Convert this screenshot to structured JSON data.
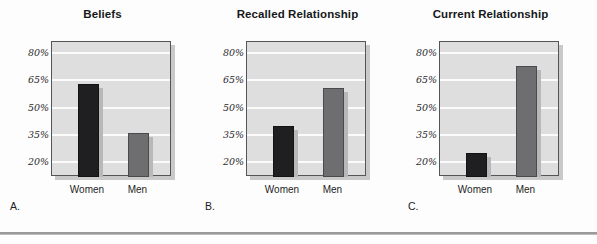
{
  "figure": {
    "panel_letters": [
      "A.",
      "B.",
      "C."
    ],
    "axis": {
      "ticks": [
        "80%",
        "65%",
        "50%",
        "35%",
        "20%"
      ],
      "categories": [
        "Women",
        "Men"
      ]
    }
  },
  "chart_data": [
    {
      "type": "bar",
      "panel": "A.",
      "title": "Beliefs",
      "categories": [
        "Women",
        "Men"
      ],
      "values": [
        63,
        36
      ],
      "series": [
        {
          "name": "Women",
          "values": [
            63
          ],
          "color": "#1f1f21"
        },
        {
          "name": "Men",
          "values": [
            36
          ],
          "color": "#6e6e70"
        }
      ],
      "xlabel": "",
      "ylabel": "",
      "ylim": [
        12,
        86
      ],
      "yticks": [
        20,
        35,
        50,
        65,
        80
      ],
      "ytick_labels": [
        "20%",
        "35%",
        "50%",
        "65%",
        "80%"
      ],
      "grid": true,
      "legend": "none"
    },
    {
      "type": "bar",
      "panel": "B.",
      "title": "Recalled Relationship",
      "categories": [
        "Women",
        "Men"
      ],
      "values": [
        40,
        61
      ],
      "series": [
        {
          "name": "Women",
          "values": [
            40
          ],
          "color": "#1f1f21"
        },
        {
          "name": "Men",
          "values": [
            61
          ],
          "color": "#6e6e70"
        }
      ],
      "xlabel": "",
      "ylabel": "",
      "ylim": [
        12,
        86
      ],
      "yticks": [
        20,
        35,
        50,
        65,
        80
      ],
      "ytick_labels": [
        "20%",
        "35%",
        "50%",
        "65%",
        "80%"
      ],
      "grid": true,
      "legend": "none"
    },
    {
      "type": "bar",
      "panel": "C.",
      "title": "Current Relationship",
      "categories": [
        "Women",
        "Men"
      ],
      "values": [
        25,
        73
      ],
      "series": [
        {
          "name": "Women",
          "values": [
            25
          ],
          "color": "#1f1f21"
        },
        {
          "name": "Men",
          "values": [
            73
          ],
          "color": "#6e6e70"
        }
      ],
      "xlabel": "",
      "ylabel": "",
      "ylim": [
        12,
        86
      ],
      "yticks": [
        20,
        35,
        50,
        65,
        80
      ],
      "ytick_labels": [
        "20%",
        "35%",
        "50%",
        "65%",
        "80%"
      ],
      "grid": true,
      "legend": "none"
    }
  ]
}
